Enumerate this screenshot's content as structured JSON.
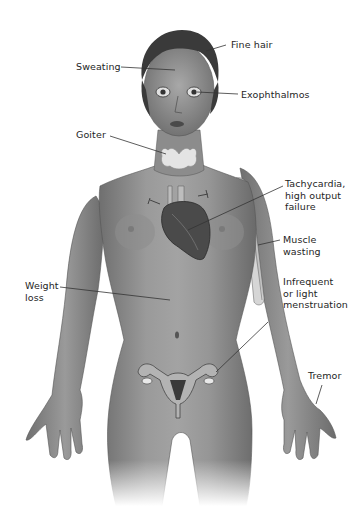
{
  "figure": {
    "labels": [
      {
        "id": "fine_hair",
        "text": "Fine hair"
      },
      {
        "id": "sweating",
        "text": "Sweating"
      },
      {
        "id": "exophthalmos",
        "text": "Exophthalmos"
      },
      {
        "id": "goiter",
        "text": "Goiter"
      },
      {
        "id": "tachycardia",
        "text": "Tachycardia,\nhigh output\nfailure"
      },
      {
        "id": "muscle_wasting",
        "text": "Muscle\nwasting"
      },
      {
        "id": "weight_loss",
        "text": "Weight\nloss"
      },
      {
        "id": "menstruation",
        "text": "Infrequent\nor light\nmenstruation"
      },
      {
        "id": "tremor",
        "text": "Tremor"
      }
    ]
  },
  "colors": {
    "skin": "#8a8a8a",
    "skin_dark": "#5a5a5a",
    "hair": "#3a3a3a",
    "thyroid": "#e4e4e4",
    "heart": "#4a4a4a",
    "leader_line": "#333333",
    "text": "#1e1e1e"
  }
}
